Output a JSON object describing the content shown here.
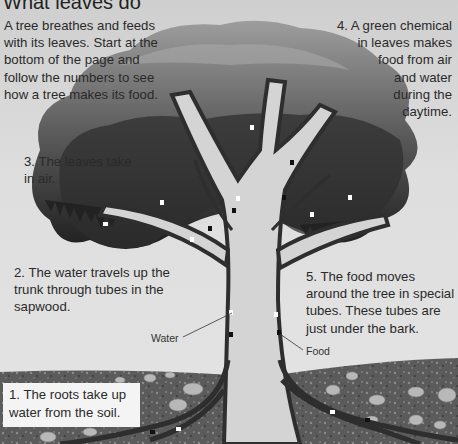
{
  "title": "What leaves do",
  "intro": "A tree breathes and feeds with its leaves. Start at the bottom of the page and follow the numbers to see how a tree makes its food.",
  "steps": {
    "s1": "1. The roots take up water from the soil.",
    "s2": "2. The water travels up the trunk through tubes in the sapwood.",
    "s3": "3. The leaves take in air.",
    "s4_lines": [
      "4. A green chemical",
      "in leaves makes",
      "food from air",
      "and water",
      "during the",
      "daytime."
    ],
    "s5": "5. The food moves around the tree in special tubes. These tubes are just under the bark."
  },
  "labels": {
    "water": "Water",
    "food": "Food"
  },
  "colors": {
    "background": "#e0e0e0",
    "canopy_dark": "#2e2e2e",
    "canopy_light": "#8a8a8a",
    "trunk": "#d6d6d6",
    "bark_tube": "#3a3a3a",
    "soil": "#5a5a5a"
  },
  "icons": {
    "water_marker": "white-arrow-up",
    "food_marker": "black-square"
  }
}
